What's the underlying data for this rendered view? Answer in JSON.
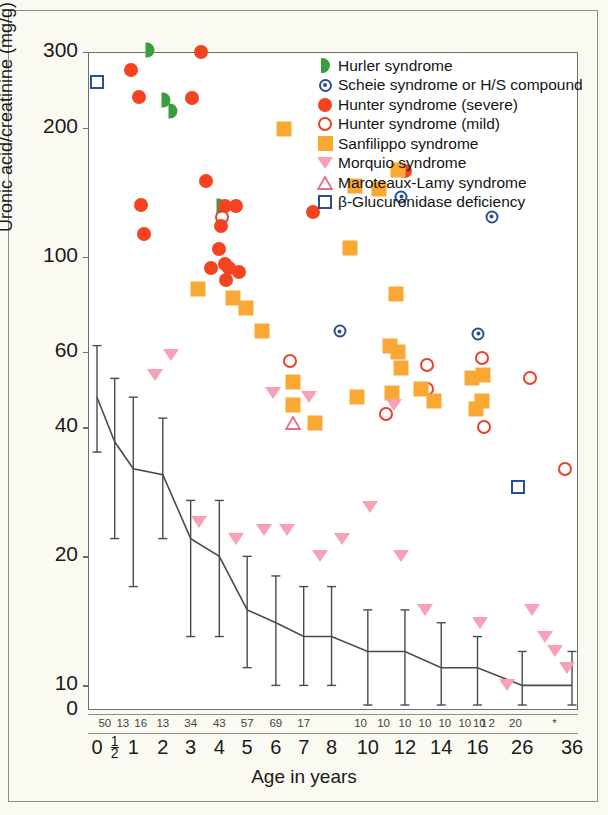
{
  "chart_data": {
    "type": "scatter",
    "title": "",
    "xlabel": "Age in years",
    "ylabel": "Uronic acid/creatinine (mg/g)",
    "yscale": "log",
    "ylim": [
      8,
      320
    ],
    "yticks": [
      300,
      200,
      100,
      60,
      40,
      20,
      10,
      0
    ],
    "ytick_labels": [
      "300",
      "200",
      "100",
      "60",
      "40",
      "20",
      "10",
      "0"
    ],
    "xticks": [
      0,
      0.5,
      1,
      2,
      3,
      4,
      5,
      6,
      7,
      8,
      10,
      12,
      14,
      16,
      26,
      36
    ],
    "xtick_labels": [
      "0",
      "1/2",
      "1",
      "2",
      "3",
      "4",
      "5",
      "6",
      "7",
      "8",
      "10",
      "12",
      "14",
      "16",
      "26",
      "36"
    ],
    "sample_size_row_label": "n",
    "sample_sizes": [
      "50",
      "13",
      "16",
      "13",
      "34",
      "43",
      "57",
      "69",
      "17",
      "10",
      "10",
      "10",
      "10",
      "10",
      "10",
      "10",
      "1",
      "2",
      "20",
      "*"
    ],
    "grid": false,
    "legend_position": "top-right",
    "legend": [
      {
        "key": "hurler",
        "label": "Hurler syndrome",
        "marker": "half-disc-right",
        "color": "#3b9e3b"
      },
      {
        "key": "scheie",
        "label": "Scheie syndrome or H/S compound",
        "marker": "ringed-dot",
        "color": "#2a4f96"
      },
      {
        "key": "hunter_severe",
        "label": "Hunter syndrome (severe)",
        "marker": "filled-circle",
        "color": "#f5421f"
      },
      {
        "key": "hunter_mild",
        "label": "Hunter syndrome (mild)",
        "marker": "open-circle",
        "color": "#e8412c"
      },
      {
        "key": "sanfilippo",
        "label": "Sanfilippo syndrome",
        "marker": "filled-square",
        "color": "#f9a833"
      },
      {
        "key": "morquio",
        "label": "Morquio syndrome",
        "marker": "filled-triangle-down",
        "color": "#f8a0b4"
      },
      {
        "key": "maroteaux",
        "label": "Maroteaux-Lamy syndrome",
        "marker": "open-triangle-up",
        "color": "#ef6a86"
      },
      {
        "key": "glucuronidase",
        "label": "β-Glucuronidase deficiency",
        "marker": "open-square",
        "color": "#2a4f96"
      }
    ],
    "series": [
      {
        "name": "Hurler syndrome",
        "key": "hurler",
        "points": [
          [
            1.55,
            303
          ],
          [
            2.1,
            232
          ],
          [
            2.35,
            218
          ],
          [
            4.05,
            131
          ]
        ]
      },
      {
        "name": "Scheie syndrome or H/S compound",
        "key": "scheie",
        "points": [
          [
            8.45,
            67
          ],
          [
            11.8,
            138
          ],
          [
            16.2,
            66
          ],
          [
            19.2,
            124
          ]
        ]
      },
      {
        "name": "Hunter syndrome (severe)",
        "key": "hunter_severe",
        "points": [
          [
            0.95,
            272
          ],
          [
            3.35,
            300
          ],
          [
            1.2,
            235
          ],
          [
            3.05,
            234
          ],
          [
            1.35,
            113
          ],
          [
            1.25,
            132
          ],
          [
            3.55,
            150
          ],
          [
            4.2,
            131
          ],
          [
            4.6,
            131
          ],
          [
            4.05,
            118
          ],
          [
            4.0,
            104
          ],
          [
            4.2,
            96
          ],
          [
            3.7,
            94
          ],
          [
            4.35,
            94
          ],
          [
            4.7,
            92
          ],
          [
            4.25,
            88
          ],
          [
            12.0,
            158
          ],
          [
            7.35,
            127
          ]
        ]
      },
      {
        "name": "Hunter syndrome (mild)",
        "key": "hunter_mild",
        "points": [
          [
            4.1,
            124
          ],
          [
            6.5,
            57
          ],
          [
            11.0,
            43
          ],
          [
            13.2,
            56
          ],
          [
            13.2,
            49
          ],
          [
            17.1,
            58
          ],
          [
            17.1,
            53
          ],
          [
            17.4,
            40
          ],
          [
            27.5,
            52
          ],
          [
            34.5,
            32
          ]
        ]
      },
      {
        "name": "Sanfilippo syndrome",
        "key": "sanfilippo",
        "points": [
          [
            6.3,
            198
          ],
          [
            3.25,
            84
          ],
          [
            4.5,
            80
          ],
          [
            4.95,
            76
          ],
          [
            5.5,
            67
          ],
          [
            9.3,
            146
          ],
          [
            10.6,
            144
          ],
          [
            11.6,
            159
          ],
          [
            9.0,
            105
          ],
          [
            11.5,
            82
          ],
          [
            11.2,
            62
          ],
          [
            11.6,
            60
          ],
          [
            11.8,
            55
          ],
          [
            11.3,
            48
          ],
          [
            12.9,
            49
          ],
          [
            13.6,
            46
          ],
          [
            15.7,
            52
          ],
          [
            15.9,
            44
          ],
          [
            17.2,
            53
          ],
          [
            17.1,
            46
          ],
          [
            6.6,
            51
          ],
          [
            6.6,
            45
          ],
          [
            7.4,
            41
          ],
          [
            9.4,
            47
          ]
        ]
      },
      {
        "name": "Morquio syndrome",
        "key": "morquio",
        "points": [
          [
            2.3,
            59
          ],
          [
            1.75,
            53
          ],
          [
            5.9,
            48
          ],
          [
            7.2,
            47
          ],
          [
            11.4,
            45
          ],
          [
            3.3,
            24
          ],
          [
            4.6,
            22
          ],
          [
            5.6,
            23
          ],
          [
            6.4,
            23
          ],
          [
            7.6,
            20
          ],
          [
            8.6,
            22
          ],
          [
            10.1,
            26
          ],
          [
            11.8,
            20
          ],
          [
            13.1,
            15
          ],
          [
            16.5,
            14
          ],
          [
            22.5,
            10
          ],
          [
            28.0,
            15
          ],
          [
            30.5,
            13
          ],
          [
            32.5,
            12
          ],
          [
            35.0,
            11
          ]
        ]
      },
      {
        "name": "Maroteaux-Lamy syndrome",
        "key": "maroteaux",
        "points": [
          [
            6.6,
            41
          ]
        ]
      },
      {
        "name": "β-Glucuronidase deficiency",
        "key": "glucuronidase",
        "points": [
          [
            0.0,
            256
          ],
          [
            25.0,
            29
          ]
        ]
      }
    ],
    "normal_range_curve": {
      "name": "Normal mean ± SD",
      "color": "#4a4a48",
      "x": [
        0,
        0.5,
        1,
        2,
        3,
        4,
        5,
        6,
        7,
        8,
        10,
        12,
        14,
        16,
        26,
        36
      ],
      "mean": [
        47,
        37,
        32,
        31,
        22,
        20,
        15,
        14,
        13,
        13,
        12,
        12,
        11,
        11,
        10,
        10
      ],
      "upper": [
        62,
        52,
        47,
        42,
        27,
        27,
        20,
        18,
        17,
        17,
        15,
        15,
        14,
        13,
        12,
        12
      ],
      "lower": [
        35,
        22,
        17,
        22,
        13,
        13,
        11,
        10,
        10,
        10,
        9,
        9,
        9,
        9,
        9,
        9
      ]
    }
  }
}
